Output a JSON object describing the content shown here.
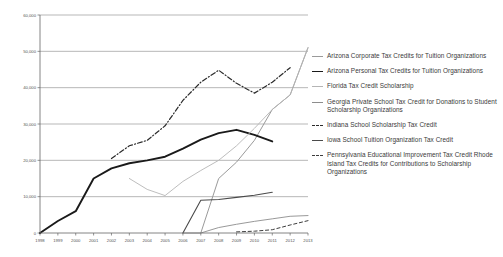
{
  "chart_data": {
    "type": "line",
    "title": "",
    "xlabel": "",
    "ylabel": "",
    "xlim": [
      1998,
      2013
    ],
    "ylim": [
      0,
      60000
    ],
    "ytick_step": 10000,
    "grid": true,
    "legend_position": "right",
    "categories": [
      1998,
      1999,
      2000,
      2001,
      2002,
      2003,
      2004,
      2005,
      2006,
      2007,
      2008,
      2009,
      2010,
      2011,
      2012,
      2013
    ],
    "ytick_labels": [
      "0",
      "10,000",
      "20,000",
      "30,000",
      "40,000",
      "50,000",
      "60,000"
    ],
    "ytick_values": [
      0,
      10000,
      20000,
      30000,
      40000,
      50000,
      60000
    ],
    "xtick_labels": [
      "1998",
      "1999",
      "2000",
      "2001",
      "2002",
      "2003",
      "2004",
      "2005",
      "2006",
      "2007",
      "2008",
      "2009",
      "2010",
      "2011",
      "2012",
      "2013"
    ],
    "series": [
      {
        "name": "Arizona Corporate Tax Credits for Tuition Organizations",
        "color": "#9a9a9a",
        "width": 1.0,
        "dash": "none",
        "x": [
          2006,
          2007,
          2008,
          2009,
          2010,
          2011,
          2012,
          2013
        ],
        "values": [
          0,
          0,
          15000,
          19500,
          25500,
          34000,
          38000,
          51000
        ]
      },
      {
        "name": "Arizona Personal Tax Credits for Tuition Organizations",
        "color": "#1a1a1a",
        "width": 1.9,
        "dash": "none",
        "x": [
          1998,
          1999,
          2000,
          2001,
          2002,
          2003,
          2004,
          2005,
          2006,
          2007,
          2008,
          2009,
          2010,
          2011
        ],
        "values": [
          0,
          3300,
          6000,
          15000,
          17800,
          19200,
          20000,
          21000,
          23200,
          25700,
          27500,
          28400,
          27000,
          25200
        ]
      },
      {
        "name": "Florida Tax Credit Scholarship",
        "color": "#b5b5b5",
        "width": 0.9,
        "dash": "none",
        "x": [
          2003,
          2004,
          2005,
          2006,
          2007,
          2008,
          2009,
          2010,
          2011,
          2012,
          2013
        ],
        "values": [
          15000,
          12000,
          10300,
          14200,
          17200,
          20000,
          24000,
          28800,
          34000,
          38000,
          51000
        ]
      },
      {
        "name": "Georgia Private School Tax Credit for Donations to Student Scholarship Organizations",
        "color": "#8d8d8d",
        "width": 0.9,
        "dash": "none",
        "x": [
          2007,
          2008,
          2009,
          2010,
          2011,
          2012,
          2013
        ],
        "values": [
          0,
          1500,
          2400,
          3200,
          3900,
          4600,
          4800
        ]
      },
      {
        "name": "Indiana School Scholarship Tax Credit",
        "color": "#2b2b2b",
        "width": 1.2,
        "dash": "dashdot",
        "x": [
          2002,
          2003,
          2004,
          2005,
          2006,
          2007,
          2008,
          2009,
          2010,
          2011,
          2012
        ],
        "values": [
          20500,
          24000,
          25500,
          29500,
          36500,
          41500,
          44800,
          41200,
          38500,
          41500,
          45500
        ]
      },
      {
        "name": "Iowa School Tuition Organization Tax Credit",
        "color": "#4a4a4a",
        "width": 1.1,
        "dash": "none",
        "x": [
          2006,
          2007,
          2008,
          2009,
          2010,
          2011
        ],
        "values": [
          0,
          9000,
          9200,
          9800,
          10400,
          11200
        ]
      },
      {
        "name": "Pennsylvania Educational Improvement Tax Credit Rhode Island Tax Credits for Contributions to Scholarship Organizations",
        "color": "#3d3d3d",
        "width": 1.0,
        "dash": "dashed",
        "x": [
          2009,
          2010,
          2011,
          2012,
          2013
        ],
        "values": [
          300,
          500,
          900,
          2200,
          3400
        ]
      }
    ]
  },
  "legend": {
    "items": [
      {
        "label": "Arizona Corporate Tax Credits for Tuition Organizations"
      },
      {
        "label": "Arizona Personal Tax Credits for Tuition Organizations"
      },
      {
        "label": "Florida Tax Credit Scholarship"
      },
      {
        "label": "Georgia Private School Tax Credit for Donations to Student Scholarship Organizations"
      },
      {
        "label": "Indiana School Scholarship Tax Credit"
      },
      {
        "label": "Iowa School Tuition Organization Tax Credit"
      },
      {
        "label": "Pennsylvania Educational Improvement Tax Credit Rhode Island Tax Credits for Contributions to Scholarship Organizations"
      }
    ]
  }
}
